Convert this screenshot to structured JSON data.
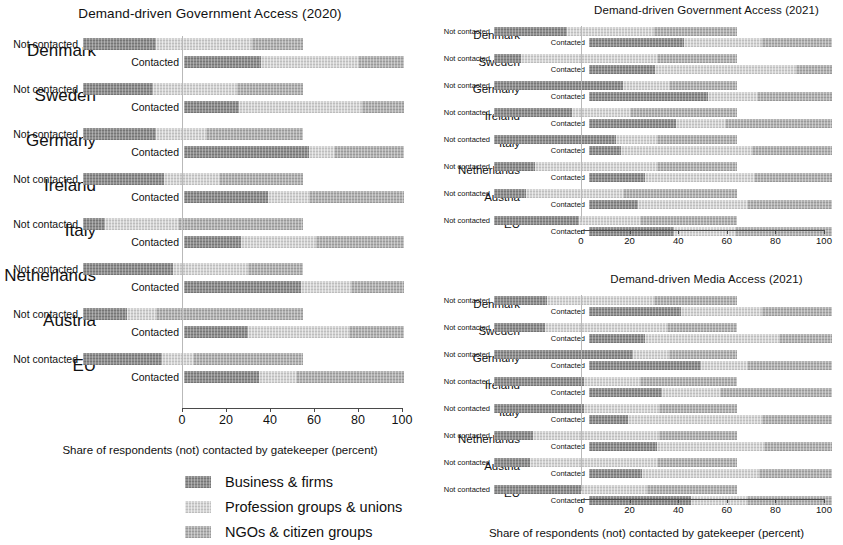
{
  "figure": {
    "axis_caption": "Share of respondents (not) contacted by gatekeeper (percent)",
    "row_labels": {
      "not_contacted": "Not contacted",
      "contacted": "Contacted"
    },
    "tick_labels": [
      "0",
      "20",
      "40",
      "60",
      "80",
      "100"
    ],
    "colors": {
      "business": "#8e8e8e",
      "profession": "#d2d2d2",
      "ngo": "#b1b1b1",
      "axis": "#4a4a4a",
      "background": "#ffffff"
    }
  },
  "legend": {
    "items": [
      {
        "label": "Business & firms",
        "color": "#8e8e8e",
        "swatch": "business-swatch"
      },
      {
        "label": "Profession groups & unions",
        "color": "#d2d2d2",
        "swatch": "profession-swatch"
      },
      {
        "label": "NGOs & citizen groups",
        "color": "#b1b1b1",
        "swatch": "ngo-swatch"
      }
    ]
  },
  "chart_data": [
    {
      "id": "government-access-2020",
      "type": "bar",
      "orientation": "horizontal",
      "stacked": true,
      "normalized": true,
      "title": "Demand-driven Government Access (2020)",
      "xlabel": "Share of respondents (not) contacted by gatekeeper (percent)",
      "ylabel": "",
      "xlim": [
        0,
        100
      ],
      "xticks": [
        0,
        20,
        40,
        60,
        80,
        100
      ],
      "grid": false,
      "legend_position": "below",
      "categories": [
        "Denmark",
        "Sweden",
        "Germany",
        "Ireland",
        "Italy",
        "Netherlands",
        "Austria",
        "EU"
      ],
      "subcategories": [
        "Not contacted",
        "Contacted"
      ],
      "series": [
        {
          "name": "Business & firms",
          "color": "#8e8e8e"
        },
        {
          "name": "Profession groups & unions",
          "color": "#d2d2d2"
        },
        {
          "name": "NGOs & citizen groups",
          "color": "#b1b1b1"
        }
      ],
      "rows": [
        {
          "country": "Denmark",
          "sub": "Not contacted",
          "values": [
            33,
            44,
            23
          ]
        },
        {
          "country": "Denmark",
          "sub": "Contacted",
          "values": [
            35,
            44,
            21
          ]
        },
        {
          "country": "Sweden",
          "sub": "Not contacted",
          "values": [
            32,
            38,
            30
          ]
        },
        {
          "country": "Sweden",
          "sub": "Contacted",
          "values": [
            25,
            56,
            19
          ]
        },
        {
          "country": "Germany",
          "sub": "Not contacted",
          "values": [
            33,
            23,
            44
          ]
        },
        {
          "country": "Germany",
          "sub": "Contacted",
          "values": [
            57,
            11,
            32
          ]
        },
        {
          "country": "Ireland",
          "sub": "Not contacted",
          "values": [
            37,
            25,
            38
          ]
        },
        {
          "country": "Ireland",
          "sub": "Contacted",
          "values": [
            38,
            19,
            43
          ]
        },
        {
          "country": "Italy",
          "sub": "Not contacted",
          "values": [
            10,
            33,
            57
          ]
        },
        {
          "country": "Italy",
          "sub": "Contacted",
          "values": [
            26,
            34,
            40
          ]
        },
        {
          "country": "Netherlands",
          "sub": "Not contacted",
          "values": [
            41,
            34,
            25
          ]
        },
        {
          "country": "Netherlands",
          "sub": "Contacted",
          "values": [
            53,
            23,
            24
          ]
        },
        {
          "country": "Austria",
          "sub": "Not contacted",
          "values": [
            20,
            13,
            67
          ]
        },
        {
          "country": "Austria",
          "sub": "Contacted",
          "values": [
            29,
            46,
            25
          ]
        },
        {
          "country": "EU",
          "sub": "Not contacted",
          "values": [
            36,
            14,
            50
          ]
        },
        {
          "country": "EU",
          "sub": "Contacted",
          "values": [
            34,
            17,
            49
          ]
        }
      ]
    },
    {
      "id": "government-access-2021",
      "type": "bar",
      "orientation": "horizontal",
      "stacked": true,
      "normalized": true,
      "title": "Demand-driven Government Access (2021)",
      "xlabel": "Share of respondents (not) contacted by gatekeeper (percent)",
      "ylabel": "",
      "xlim": [
        0,
        100
      ],
      "xticks": [
        0,
        20,
        40,
        60,
        80,
        100
      ],
      "grid": false,
      "legend_position": "shared",
      "categories": [
        "Denmark",
        "Sweden",
        "Germany",
        "Ireland",
        "Italy",
        "Netherlands",
        "Austria",
        "EU"
      ],
      "subcategories": [
        "Not contacted",
        "Contacted"
      ],
      "series": [
        {
          "name": "Business & firms",
          "color": "#8e8e8e"
        },
        {
          "name": "Profession groups & unions",
          "color": "#d2d2d2"
        },
        {
          "name": "NGOs & citizen groups",
          "color": "#b1b1b1"
        }
      ],
      "rows": [
        {
          "country": "Denmark",
          "sub": "Not contacted",
          "values": [
            30,
            36,
            34
          ]
        },
        {
          "country": "Denmark",
          "sub": "Contacted",
          "values": [
            39,
            32,
            29
          ]
        },
        {
          "country": "Sweden",
          "sub": "Not contacted",
          "values": [
            11,
            56,
            33
          ]
        },
        {
          "country": "Sweden",
          "sub": "Contacted",
          "values": [
            27,
            58,
            15
          ]
        },
        {
          "country": "Germany",
          "sub": "Not contacted",
          "values": [
            53,
            19,
            28
          ]
        },
        {
          "country": "Germany",
          "sub": "Contacted",
          "values": [
            49,
            20,
            31
          ]
        },
        {
          "country": "Ireland",
          "sub": "Not contacted",
          "values": [
            32,
            24,
            44
          ]
        },
        {
          "country": "Ireland",
          "sub": "Contacted",
          "values": [
            36,
            20,
            44
          ]
        },
        {
          "country": "Italy",
          "sub": "Not contacted",
          "values": [
            50,
            17,
            33
          ]
        },
        {
          "country": "Italy",
          "sub": "Contacted",
          "values": [
            13,
            54,
            33
          ]
        },
        {
          "country": "Netherlands",
          "sub": "Not contacted",
          "values": [
            17,
            50,
            33
          ]
        },
        {
          "country": "Netherlands",
          "sub": "Contacted",
          "values": [
            23,
            45,
            32
          ]
        },
        {
          "country": "Austria",
          "sub": "Not contacted",
          "values": [
            13,
            40,
            47
          ]
        },
        {
          "country": "Austria",
          "sub": "Contacted",
          "values": [
            20,
            45,
            35
          ]
        },
        {
          "country": "EU",
          "sub": "Not contacted",
          "values": [
            35,
            25,
            40
          ]
        },
        {
          "country": "EU",
          "sub": "Contacted",
          "values": [
            35,
            25,
            40
          ]
        }
      ]
    },
    {
      "id": "media-access-2021",
      "type": "bar",
      "orientation": "horizontal",
      "stacked": true,
      "normalized": true,
      "title": "Demand-driven Media Access (2021)",
      "xlabel": "Share of respondents (not) contacted by gatekeeper (percent)",
      "ylabel": "",
      "xlim": [
        0,
        100
      ],
      "xticks": [
        0,
        20,
        40,
        60,
        80,
        100
      ],
      "grid": false,
      "legend_position": "shared",
      "categories": [
        "Denmark",
        "Sweden",
        "Germany",
        "Ireland",
        "Italy",
        "Netherlands",
        "Austria",
        "EU"
      ],
      "subcategories": [
        "Not contacted",
        "Contacted"
      ],
      "series": [
        {
          "name": "Business & firms",
          "color": "#8e8e8e"
        },
        {
          "name": "Profession groups & unions",
          "color": "#d2d2d2"
        },
        {
          "name": "NGOs & citizen groups",
          "color": "#b1b1b1"
        }
      ],
      "rows": [
        {
          "country": "Denmark",
          "sub": "Not contacted",
          "values": [
            22,
            44,
            34
          ]
        },
        {
          "country": "Denmark",
          "sub": "Contacted",
          "values": [
            38,
            33,
            29
          ]
        },
        {
          "country": "Sweden",
          "sub": "Not contacted",
          "values": [
            21,
            50,
            29
          ]
        },
        {
          "country": "Sweden",
          "sub": "Contacted",
          "values": [
            23,
            55,
            22
          ]
        },
        {
          "country": "Germany",
          "sub": "Not contacted",
          "values": [
            57,
            15,
            28
          ]
        },
        {
          "country": "Germany",
          "sub": "Contacted",
          "values": [
            46,
            19,
            35
          ]
        },
        {
          "country": "Ireland",
          "sub": "Not contacted",
          "values": [
            37,
            23,
            40
          ]
        },
        {
          "country": "Ireland",
          "sub": "Contacted",
          "values": [
            30,
            24,
            46
          ]
        },
        {
          "country": "Italy",
          "sub": "Not contacted",
          "values": [
            37,
            31,
            32
          ]
        },
        {
          "country": "Italy",
          "sub": "Contacted",
          "values": [
            16,
            55,
            29
          ]
        },
        {
          "country": "Netherlands",
          "sub": "Not contacted",
          "values": [
            16,
            52,
            32
          ]
        },
        {
          "country": "Netherlands",
          "sub": "Contacted",
          "values": [
            28,
            44,
            28
          ]
        },
        {
          "country": "Austria",
          "sub": "Not contacted",
          "values": [
            15,
            52,
            33
          ]
        },
        {
          "country": "Austria",
          "sub": "Contacted",
          "values": [
            22,
            48,
            30
          ]
        },
        {
          "country": "EU",
          "sub": "Not contacted",
          "values": [
            36,
            27,
            37
          ]
        },
        {
          "country": "EU",
          "sub": "Contacted",
          "values": [
            42,
            23,
            35
          ]
        }
      ]
    }
  ]
}
